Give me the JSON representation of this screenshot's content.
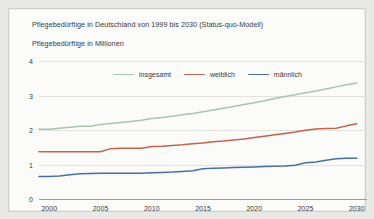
{
  "card": {
    "title": "Pflegebedürftige in Deutschland von 1999 bis 2030 (Status-quo-Modell)",
    "subtitle": "Pflegebedürftige in Millionen"
  },
  "legend": [
    {
      "label": "insgesamt",
      "color": "#a9c3ae"
    },
    {
      "label": "weiblich",
      "color": "#c4624e"
    },
    {
      "label": "männlich",
      "color": "#4a6f9c"
    }
  ],
  "chart_data": {
    "type": "line",
    "title": "Pflegebedürftige in Deutschland von 1999 bis 2030 (Status-quo-Modell)",
    "subtitle": "Pflegebedürftige in Millionen",
    "xlabel": "",
    "ylabel": "Pflegebedürftige in Millionen",
    "xlim": [
      1999,
      2031
    ],
    "ylim": [
      0,
      4
    ],
    "xticks": [
      2000,
      2005,
      2010,
      2015,
      2020,
      2025,
      2030
    ],
    "yticks": [
      0,
      1,
      2,
      3,
      4
    ],
    "grid": true,
    "legend_position": "top-center",
    "x": [
      1999,
      2000,
      2001,
      2002,
      2003,
      2004,
      2005,
      2006,
      2007,
      2008,
      2009,
      2010,
      2011,
      2012,
      2013,
      2014,
      2015,
      2016,
      2017,
      2018,
      2019,
      2020,
      2021,
      2022,
      2023,
      2024,
      2025,
      2026,
      2027,
      2028,
      2029,
      2030
    ],
    "series": [
      {
        "name": "insgesamt",
        "color": "#a9c3ae",
        "values": [
          2.02,
          2.02,
          2.05,
          2.08,
          2.11,
          2.11,
          2.16,
          2.19,
          2.22,
          2.25,
          2.28,
          2.33,
          2.36,
          2.4,
          2.44,
          2.48,
          2.53,
          2.58,
          2.63,
          2.68,
          2.74,
          2.79,
          2.85,
          2.91,
          2.97,
          3.02,
          3.08,
          3.13,
          3.19,
          3.25,
          3.31,
          3.36
        ]
      },
      {
        "name": "weiblich",
        "color": "#c4624e",
        "values": [
          1.37,
          1.37,
          1.37,
          1.37,
          1.37,
          1.37,
          1.37,
          1.46,
          1.47,
          1.47,
          1.47,
          1.52,
          1.53,
          1.55,
          1.57,
          1.6,
          1.62,
          1.66,
          1.68,
          1.71,
          1.74,
          1.78,
          1.82,
          1.86,
          1.9,
          1.94,
          1.99,
          2.03,
          2.04,
          2.05,
          2.12,
          2.18
        ]
      },
      {
        "name": "männlich",
        "color": "#4a6f9c",
        "values": [
          0.65,
          0.65,
          0.67,
          0.7,
          0.73,
          0.74,
          0.75,
          0.75,
          0.75,
          0.75,
          0.75,
          0.76,
          0.77,
          0.78,
          0.8,
          0.82,
          0.88,
          0.89,
          0.9,
          0.91,
          0.92,
          0.93,
          0.94,
          0.95,
          0.96,
          0.98,
          1.05,
          1.07,
          1.12,
          1.17,
          1.18,
          1.18
        ]
      }
    ]
  }
}
